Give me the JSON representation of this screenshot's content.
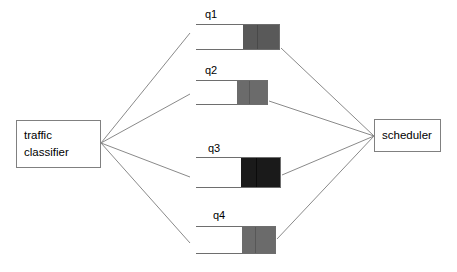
{
  "diagram": {
    "type": "block-flow-diagram",
    "background_color": "#ffffff",
    "line_color": "#8a8a8a",
    "box_border_color": "#808080",
    "nodes": {
      "classifier": {
        "label_line1": "traffic",
        "label_line2": "classifier",
        "x": 16,
        "y": 120,
        "width": 85,
        "height": 48
      },
      "scheduler": {
        "label": "scheduler",
        "x": 374,
        "y": 119,
        "width": 67,
        "height": 33
      }
    },
    "queues": [
      {
        "caption": "q1",
        "caption_x": 205,
        "caption_y": 8,
        "x": 196,
        "y": 24,
        "width": 84,
        "height": 26,
        "fill_width": 36,
        "fill_color": "#595959",
        "divider_color": "#3d3d3d",
        "divider_offset": 14,
        "occupancy_label": "partially full"
      },
      {
        "caption": "q2",
        "caption_x": 205,
        "caption_y": 64,
        "x": 196,
        "y": 80,
        "width": 72,
        "height": 25,
        "fill_width": 30,
        "fill_color": "#6b6b6b",
        "divider_color": "#4a4a4a",
        "divider_offset": 12,
        "occupancy_label": "partially full"
      },
      {
        "caption": "q3",
        "caption_x": 208,
        "caption_y": 142,
        "x": 196,
        "y": 157,
        "width": 85,
        "height": 31,
        "fill_width": 39,
        "fill_color": "#1a1a1a",
        "divider_color": "#000000",
        "divider_offset": 15,
        "occupancy_label": "full"
      },
      {
        "caption": "q4",
        "caption_x": 213,
        "caption_y": 209,
        "x": 196,
        "y": 226,
        "width": 80,
        "height": 28,
        "fill_width": 33,
        "fill_color": "#6b6b6b",
        "divider_color": "#474747",
        "divider_offset": 13,
        "occupancy_label": "partially full"
      }
    ],
    "edges": {
      "classifier_fanout_point": {
        "x": 101,
        "y": 143
      },
      "scheduler_fanin_point": {
        "x": 374,
        "y": 136
      },
      "in_edges": [
        {
          "from_node": "classifier",
          "to_queue": "q1",
          "x2": 190,
          "y2": 33
        },
        {
          "from_node": "classifier",
          "to_queue": "q2",
          "x2": 190,
          "y2": 94
        },
        {
          "from_node": "classifier",
          "to_queue": "q3",
          "x2": 190,
          "y2": 177
        },
        {
          "from_node": "classifier",
          "to_queue": "q4",
          "x2": 190,
          "y2": 243
        }
      ],
      "out_edges": [
        {
          "from_queue": "q1",
          "to_node": "scheduler",
          "x1": 281,
          "y1": 48
        },
        {
          "from_queue": "q2",
          "to_node": "scheduler",
          "x1": 269,
          "y1": 101
        },
        {
          "from_queue": "q3",
          "to_node": "scheduler",
          "x1": 282,
          "y1": 175
        },
        {
          "from_queue": "q4",
          "to_node": "scheduler",
          "x1": 277,
          "y1": 239
        }
      ]
    }
  }
}
